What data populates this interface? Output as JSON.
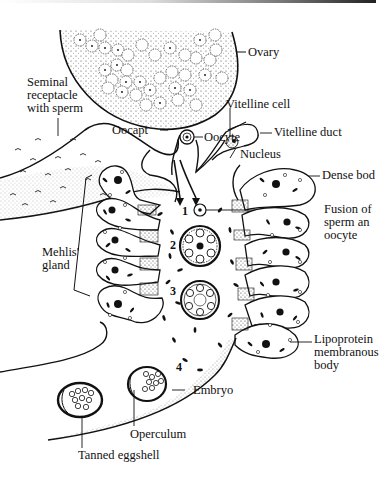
{
  "diagram": {
    "labels": {
      "ovary": "Ovary",
      "seminal_receptacle": [
        "Seminal",
        "receptacle",
        "with sperm"
      ],
      "oocapt": "Oocapt",
      "oocyte": "Oocyte",
      "vitelline_cell": "Vitelline cell",
      "vitelline_duct": "Vitelline duct",
      "nucleus": "Nucleus",
      "dense_body": "Dense bod",
      "fusion": [
        "Fusion of",
        "sperm an",
        "oocyte"
      ],
      "mehlis_gland": [
        "Mehlis'",
        "gland"
      ],
      "lipoprotein": [
        "Lipoprotein",
        "membranous",
        "body"
      ],
      "embryo": "Embryo",
      "operculum": "Operculum",
      "tanned_eggshell": "Tanned eggshell"
    },
    "stages": [
      "1",
      "2",
      "3",
      "4"
    ],
    "colors": {
      "ink": "#111111",
      "background": "#ffffff",
      "stipple": "#555555"
    }
  }
}
